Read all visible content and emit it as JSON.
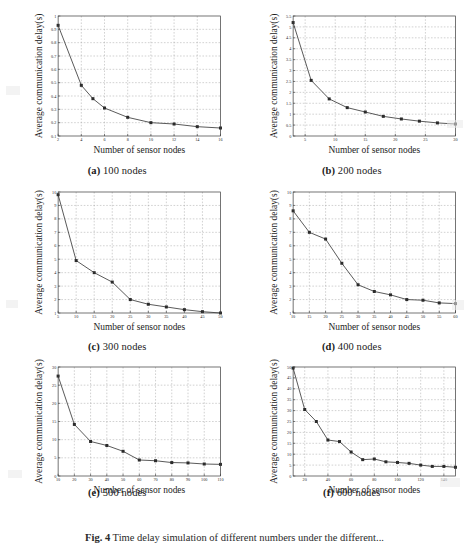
{
  "figure": {
    "caption_prefix": "Fig. 4",
    "caption_text": "Time delay simulation of different numbers under the different..."
  },
  "axis_labels": {
    "x": "Number of sensor nodes",
    "y": "Average communication delay(s)"
  },
  "panels": [
    {
      "id": "a",
      "tag": "(a)",
      "caption": "100 nodes",
      "chart_data": {
        "type": "line",
        "title": "(a) 100 nodes",
        "xlabel": "Number of sensor nodes",
        "ylabel": "Average communication delay(s)",
        "xlim": [
          2,
          16
        ],
        "ylim": [
          0.1,
          1.0
        ],
        "xticks": [
          2,
          4,
          6,
          8,
          10,
          12,
          14,
          16
        ],
        "yticks": [
          0.1,
          0.2,
          0.3,
          0.4,
          0.5,
          0.6,
          0.7,
          0.8,
          0.9,
          1.0
        ],
        "grid": true,
        "legend": "none",
        "x": [
          2,
          4,
          5,
          6,
          8,
          10,
          12,
          14,
          16
        ],
        "values": [
          0.93,
          0.48,
          0.38,
          0.31,
          0.24,
          0.2,
          0.19,
          0.17,
          0.16
        ]
      }
    },
    {
      "id": "b",
      "tag": "(b)",
      "caption": "200 nodes",
      "chart_data": {
        "type": "line",
        "title": "(b) 200 nodes",
        "xlabel": "Number of sensor nodes",
        "ylabel": "Average communication delay(s)",
        "xlim": [
          3,
          30
        ],
        "ylim": [
          0,
          5.5
        ],
        "xticks": [
          5,
          10,
          15,
          20,
          25,
          30
        ],
        "yticks": [
          0,
          0.5,
          1,
          1.5,
          2,
          2.5,
          3,
          3.5,
          4,
          4.5,
          5,
          5.5
        ],
        "grid": true,
        "legend": "none",
        "x": [
          3,
          6,
          9,
          12,
          15,
          18,
          21,
          24,
          27,
          30
        ],
        "values": [
          5.2,
          2.55,
          1.7,
          1.3,
          1.1,
          0.9,
          0.78,
          0.68,
          0.6,
          0.55
        ]
      }
    },
    {
      "id": "c",
      "tag": "(c)",
      "caption": "300 nodes",
      "chart_data": {
        "type": "line",
        "title": "(c) 300 nodes",
        "xlabel": "Number of sensor nodes",
        "ylabel": "Average communication delay(s)",
        "xlim": [
          5,
          50
        ],
        "ylim": [
          1,
          10
        ],
        "xticks": [
          5,
          10,
          15,
          20,
          25,
          30,
          35,
          40,
          45,
          50
        ],
        "yticks": [
          1,
          2,
          3,
          4,
          5,
          6,
          7,
          8,
          9,
          10
        ],
        "grid": true,
        "legend": "none",
        "x": [
          5,
          10,
          15,
          20,
          25,
          30,
          35,
          40,
          45,
          50
        ],
        "values": [
          9.8,
          4.9,
          4.0,
          3.3,
          2.0,
          1.65,
          1.45,
          1.25,
          1.1,
          1.0
        ]
      }
    },
    {
      "id": "d",
      "tag": "(d)",
      "caption": "400 nodes",
      "chart_data": {
        "type": "line",
        "title": "(d) 400 nodes",
        "xlabel": "Number of sensor nodes",
        "ylabel": "Average communication delay(s)",
        "xlim": [
          10,
          60
        ],
        "ylim": [
          1,
          10
        ],
        "xticks": [
          10,
          15,
          20,
          25,
          30,
          35,
          40,
          45,
          50,
          55,
          60
        ],
        "yticks": [
          1,
          2,
          3,
          4,
          5,
          6,
          7,
          8,
          9,
          10
        ],
        "grid": true,
        "legend": "none",
        "x": [
          10,
          15,
          20,
          25,
          30,
          35,
          40,
          45,
          50,
          55,
          60
        ],
        "values": [
          8.6,
          7.0,
          6.5,
          4.7,
          3.1,
          2.6,
          2.35,
          2.0,
          1.95,
          1.75,
          1.7
        ]
      }
    },
    {
      "id": "e",
      "tag": "(e)",
      "caption": "500 nodes",
      "chart_data": {
        "type": "line",
        "title": "(e) 500 nodes",
        "xlabel": "Number of sensor nodes",
        "ylabel": "Average communication delay(s)",
        "xlim": [
          10,
          110
        ],
        "ylim": [
          0,
          30
        ],
        "xticks": [
          10,
          20,
          30,
          40,
          50,
          60,
          70,
          80,
          90,
          100,
          110
        ],
        "yticks": [
          0,
          5,
          10,
          15,
          20,
          25,
          30
        ],
        "grid": true,
        "legend": "none",
        "x": [
          10,
          20,
          30,
          40,
          50,
          60,
          70,
          80,
          90,
          100,
          110
        ],
        "values": [
          27.5,
          14.2,
          9.5,
          8.4,
          6.8,
          4.4,
          4.2,
          3.7,
          3.6,
          3.3,
          3.2
        ]
      }
    },
    {
      "id": "f",
      "tag": "(f)",
      "caption": "600 nodes",
      "chart_data": {
        "type": "line",
        "title": "(f) 600 nodes",
        "xlabel": "Number of sensor nodes",
        "ylabel": "Average communication delay(s)",
        "xlim": [
          10,
          150
        ],
        "ylim": [
          0,
          50
        ],
        "xticks": [
          20,
          40,
          60,
          80,
          100,
          120,
          140
        ],
        "yticks": [
          0,
          5,
          10,
          15,
          20,
          25,
          30,
          35,
          40,
          45,
          50
        ],
        "grid": true,
        "legend": "none",
        "x": [
          10,
          20,
          30,
          40,
          50,
          60,
          70,
          80,
          90,
          100,
          110,
          120,
          130,
          140,
          150
        ],
        "values": [
          49.5,
          30.5,
          25.0,
          16.5,
          15.8,
          11.0,
          7.5,
          7.8,
          6.5,
          6.2,
          5.8,
          5.0,
          4.4,
          4.4,
          4.0
        ]
      }
    }
  ]
}
